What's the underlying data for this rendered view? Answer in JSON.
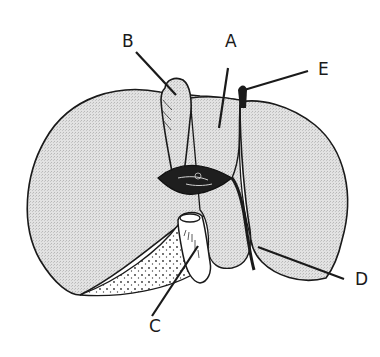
{
  "diagram": {
    "type": "anatomical line drawing",
    "fill_color": "#e4e4e4",
    "stroke_color": "#1a1a1a",
    "labels": [
      {
        "id": "A",
        "text": "A",
        "x": 225,
        "y": 33
      },
      {
        "id": "B",
        "text": "B",
        "x": 122,
        "y": 33
      },
      {
        "id": "C",
        "text": "C",
        "x": 149,
        "y": 318
      },
      {
        "id": "D",
        "text": "D",
        "x": 355,
        "y": 271
      },
      {
        "id": "E",
        "text": "E",
        "x": 318,
        "y": 61
      }
    ]
  }
}
